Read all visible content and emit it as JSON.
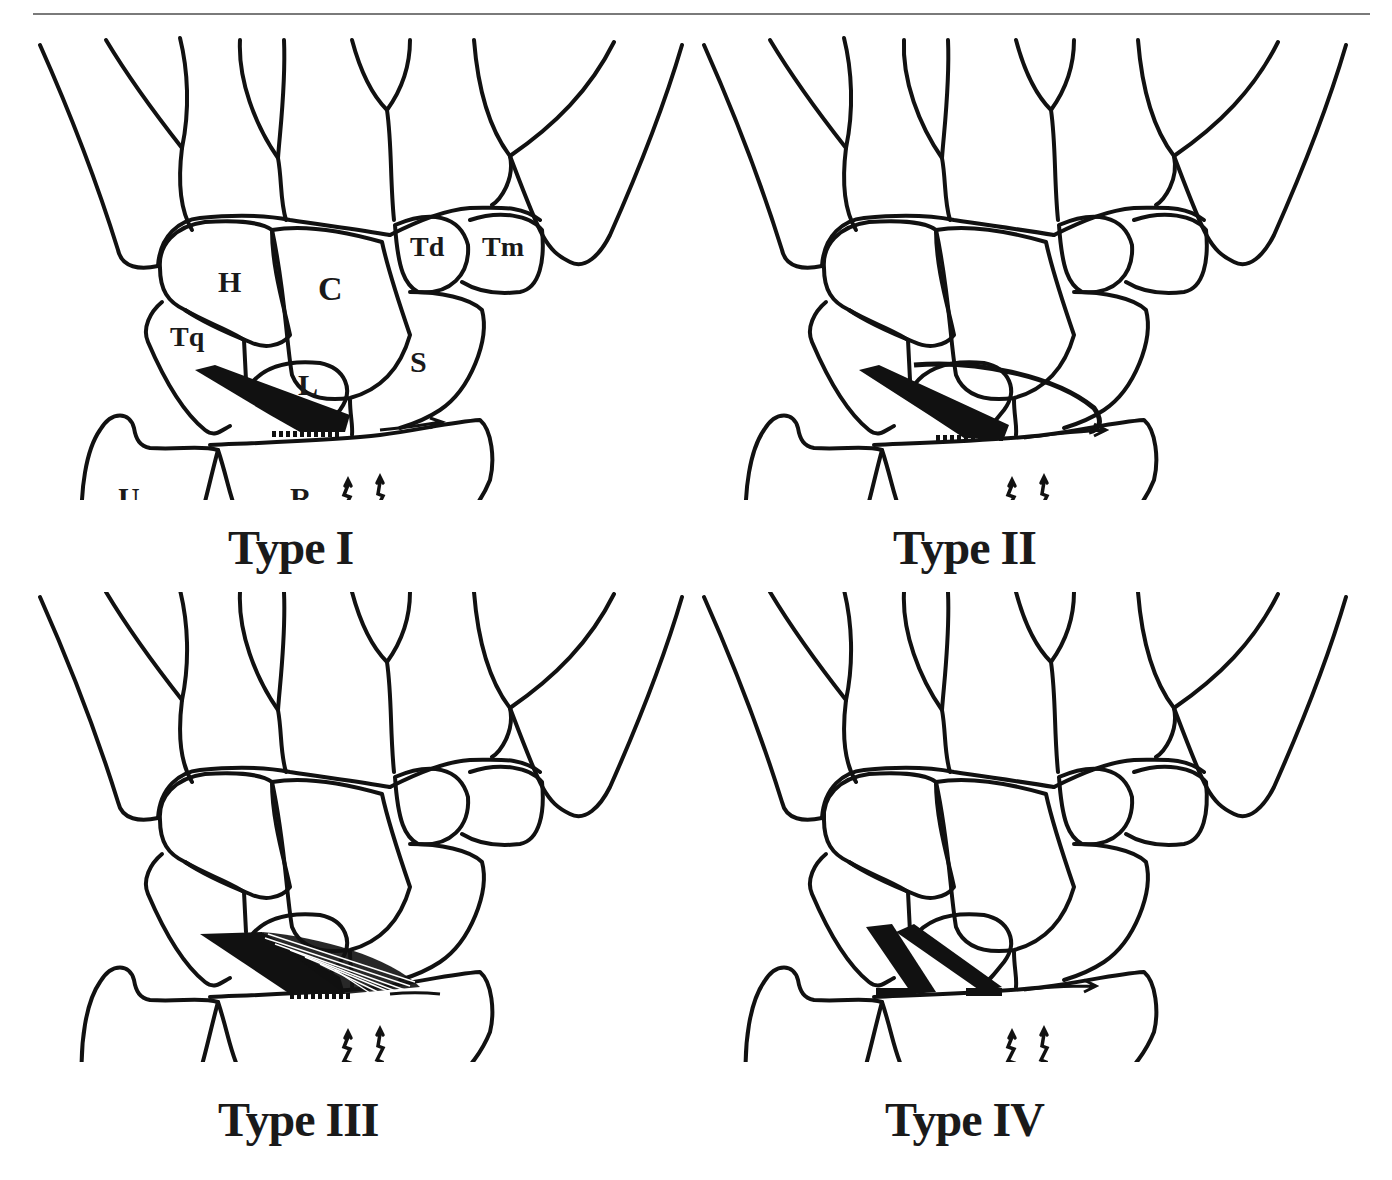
{
  "figure": {
    "panels": [
      {
        "id": "type-1",
        "caption": "Type I",
        "labels": {
          "H": "H",
          "C": "C",
          "Td": "Td",
          "Tm": "Tm",
          "Tq": "Tq",
          "L": "L",
          "S": "S",
          "U": "U",
          "R": "R"
        }
      },
      {
        "id": "type-2",
        "caption": "Type II"
      },
      {
        "id": "type-3",
        "caption": "Type III"
      },
      {
        "id": "type-4",
        "caption": "Type IV"
      }
    ],
    "colors": {
      "line": "#111111",
      "background": "#ffffff",
      "rule": "#7a7a7a"
    }
  }
}
